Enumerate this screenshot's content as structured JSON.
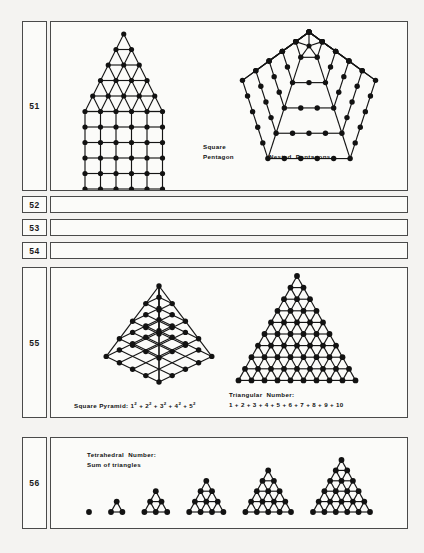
{
  "page": {
    "background": "#f4f3f1",
    "ink": "#121212",
    "border_color": "#4a4a4a"
  },
  "rows": [
    {
      "number": "51",
      "height": 178,
      "empty": false,
      "figures": [
        {
          "name": "square-pentagon",
          "caption_line1": "Square",
          "caption_line2": "Pentagon",
          "type": "triangle-on-square",
          "triangle_rows": 6,
          "square_rows": 6,
          "square_cols": 6,
          "dot_count": 57
        },
        {
          "name": "nested-pentagons",
          "caption_line1": "Nested  Pentagons",
          "caption_line2": "",
          "type": "nested-pentagons",
          "rings": 5,
          "dots_per_side": [
            1,
            2,
            3,
            4,
            5
          ]
        }
      ]
    },
    {
      "number": "52",
      "height": 19,
      "empty": true,
      "figures": []
    },
    {
      "number": "53",
      "height": 19,
      "empty": true,
      "figures": []
    },
    {
      "number": "54",
      "height": 19,
      "empty": true,
      "figures": []
    },
    {
      "number": "55",
      "height": 152,
      "empty": false,
      "figures": [
        {
          "name": "square-pyramid",
          "caption_line1": "Square Pyramid: 1",
          "caption_line2": "",
          "type": "square-pyramid-isometric",
          "levels": 5,
          "formula_terms": [
            "1",
            "2",
            "3",
            "4",
            "5"
          ],
          "formula_exponent": "2",
          "formula_label": "Square Pyramid:"
        },
        {
          "name": "triangular-number",
          "caption_line1": "Triangular  Number:",
          "caption_line2": "1 + 2 + 3 + 4 + 5 + 6 + 7 + 8 + 9 + 10",
          "type": "triangle",
          "triangle_rows": 10,
          "dot_count": 55
        }
      ]
    },
    {
      "number": "56",
      "height": 93,
      "empty": false,
      "figures": [
        {
          "name": "tetrahedral-number",
          "caption_line1": "Tetrahedral  Number:",
          "caption_line2": "Sum of triangles",
          "type": "triangle-series",
          "triangle_sizes": [
            1,
            2,
            3,
            4,
            5,
            6
          ],
          "triangle_dot_counts": [
            1,
            3,
            6,
            10,
            15,
            21
          ]
        }
      ]
    }
  ]
}
